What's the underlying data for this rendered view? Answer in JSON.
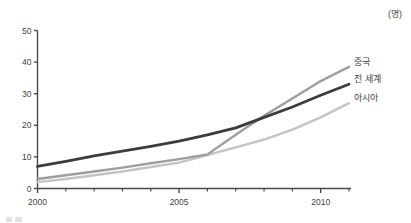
{
  "unit": {
    "label": "(명)"
  },
  "chart_data": {
    "type": "line",
    "title": "",
    "subtitle": "",
    "xlabel": "",
    "ylabel": "",
    "unit_label": "(명)",
    "xlim": [
      2000,
      2011
    ],
    "ylim": [
      0,
      50
    ],
    "grid": false,
    "legend_position": "inline-right-end-of-line",
    "x_ticks_major": [
      2000,
      2005,
      2010
    ],
    "x_ticks_minor": [
      2001,
      2002,
      2003,
      2004,
      2006,
      2007,
      2008,
      2009,
      2011
    ],
    "x_tick_labels": [
      "2000",
      "2005",
      "2010"
    ],
    "y_ticks": [
      0,
      10,
      20,
      30,
      40,
      50
    ],
    "y_tick_labels": [
      "0",
      "10",
      "20",
      "30",
      "40",
      "50"
    ],
    "x": [
      2000,
      2001,
      2002,
      2003,
      2004,
      2005,
      2006,
      2007,
      2008,
      2009,
      2010,
      2011
    ],
    "series": [
      {
        "name": "중국",
        "color": "#9e9e9e",
        "label": "중국",
        "values": [
          3.0,
          4.2,
          5.4,
          6.6,
          8.0,
          9.3,
          10.8,
          17.0,
          23.0,
          28.5,
          34.0,
          38.5
        ]
      },
      {
        "name": "전 세계",
        "color": "#3c3c3c",
        "label": "전 세계",
        "values": [
          7.0,
          8.6,
          10.3,
          11.8,
          13.3,
          15.0,
          17.0,
          19.2,
          22.5,
          25.8,
          29.5,
          33.0
        ]
      },
      {
        "name": "아시아",
        "color": "#c4c4c4",
        "label": "아시아",
        "values": [
          2.0,
          3.0,
          4.2,
          5.4,
          6.8,
          8.2,
          10.6,
          13.0,
          15.5,
          18.6,
          22.5,
          27.0
        ]
      }
    ]
  },
  "axis": {
    "y_labels": [
      "50",
      "40",
      "30",
      "20",
      "10",
      "0"
    ],
    "x_labels": [
      "2000",
      "2005",
      "2010"
    ]
  },
  "series_labels": {
    "china": "중국",
    "world": "전 세계",
    "asia": "아시아"
  },
  "colors": {
    "china": "#9e9e9e",
    "world": "#3c3c3c",
    "asia": "#c4c4c4",
    "axis": "#4a4a4a",
    "text": "#3f3f3f",
    "background": "#ffffff"
  }
}
